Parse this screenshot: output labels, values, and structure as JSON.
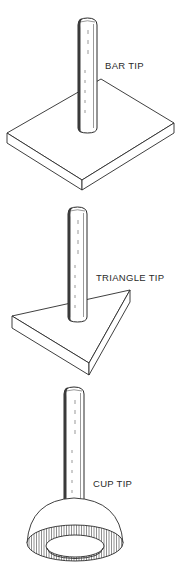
{
  "figure": {
    "items": [
      {
        "id": "bar",
        "label": "BAR TIP",
        "shape": "square-plate"
      },
      {
        "id": "triangle",
        "label": "TRIANGLE TIP",
        "shape": "triangular-plate"
      },
      {
        "id": "cup",
        "label": "CUP TIP",
        "shape": "hemispherical-cup"
      }
    ],
    "colors": {
      "line": "#2a2a2a",
      "background": "#ffffff"
    }
  }
}
